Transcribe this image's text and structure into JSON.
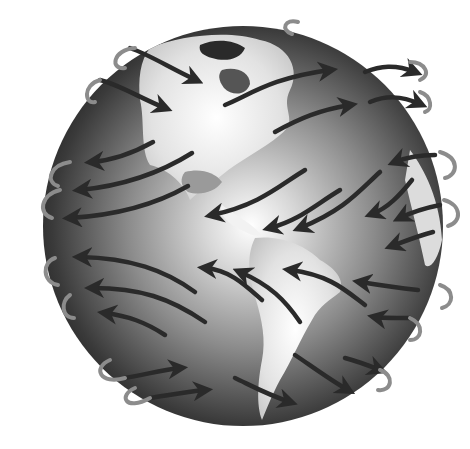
{
  "figure": {
    "globe": {
      "cx": 243,
      "cy": 226,
      "r": 200
    },
    "colors": {
      "background": "#ffffff",
      "ocean_dark": "#1a1a1a",
      "ocean_mid": "#6e6e6e",
      "highlight": "#ffffff",
      "land": "#e6e6e6",
      "arrow": "#2a2a2a",
      "ribbon": "#9a9a9a"
    },
    "wind_bands": [
      {
        "name": "polar-easterlies-north",
        "direction": "east-to-west"
      },
      {
        "name": "westerlies-north",
        "direction": "west-to-east"
      },
      {
        "name": "trade-winds-north",
        "direction": "east-to-west"
      },
      {
        "name": "trade-winds-south",
        "direction": "east-to-west"
      },
      {
        "name": "westerlies-south",
        "direction": "west-to-east"
      }
    ]
  }
}
